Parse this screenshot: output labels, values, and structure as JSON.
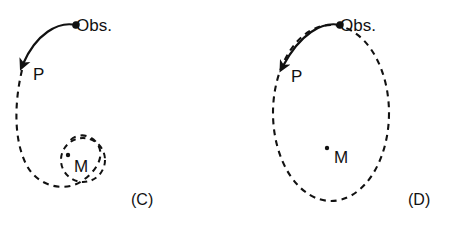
{
  "figure": {
    "type": "diagram",
    "background_color": "#ffffff",
    "ink_color": "#111111",
    "width": 463,
    "height": 228
  },
  "panels": [
    {
      "id": "panel-c",
      "caption": "(C)",
      "caption_pos": {
        "x": 131,
        "y": 205
      },
      "orbit_kind": "inward-spiral",
      "labels": {
        "observer": "Obs.",
        "observer_pos": {
          "x": 76,
          "y": 31
        },
        "periapsis": "P",
        "periapsis_pos": {
          "x": 33,
          "y": 80
        },
        "mass": "M",
        "mass_pos": {
          "x": 74,
          "y": 172
        }
      },
      "mass_dot": {
        "x": 68,
        "y": 155,
        "r": 2.2
      },
      "arrow": {
        "path": "M 76 25 C 58 21, 36 34, 23 64",
        "head_tip": {
          "x": 21,
          "y": 72
        }
      },
      "spiral_path": "M 22 70 C 14 104, 14 140, 26 164 C 38 188, 66 192, 82 181 C 98 170, 106 154, 96 142 C 88 132, 72 134, 68 144",
      "inner_circle": {
        "cx": 83,
        "cy": 160,
        "rx": 22,
        "ry": 22
      }
    },
    {
      "id": "panel-d",
      "caption": "(D)",
      "caption_pos": {
        "x": 408,
        "y": 205
      },
      "orbit_kind": "closed-ellipse",
      "labels": {
        "observer": "Obs.",
        "observer_pos": {
          "x": 340,
          "y": 31
        },
        "periapsis": "P",
        "periapsis_pos": {
          "x": 291,
          "y": 82
        },
        "mass": "M",
        "mass_pos": {
          "x": 334,
          "y": 163
        },
        "mass_dot": {
          "x": 327,
          "y": 148,
          "r": 2.2
        }
      },
      "arrow": {
        "path": "M 340 25 C 322 21, 300 34, 283 66",
        "head_tip": {
          "x": 280,
          "y": 74
        }
      },
      "ellipse": {
        "cx": 331,
        "cy": 113,
        "rx": 58,
        "ry": 88
      }
    }
  ],
  "legend_glyphs": {
    "observer_arrow": "curved-arrow-icon",
    "orbit_trace": "dashed-orbit-icon",
    "central_mass": "mass-point-icon"
  }
}
